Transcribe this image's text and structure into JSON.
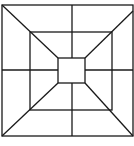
{
  "figure": {
    "stroke_color": "#1a1a1a",
    "background": "#ffffff",
    "squares": [
      {
        "name": "outer",
        "x": 2,
        "y": 5,
        "w": 131,
        "h": 131
      },
      {
        "name": "middle",
        "x": 30,
        "y": 32,
        "w": 82,
        "h": 78
      },
      {
        "name": "inner",
        "x": 58,
        "y": 58,
        "w": 27,
        "h": 25
      }
    ],
    "center_lines": {
      "vertical_x": 72,
      "horizontal_y": 70
    },
    "diagonals": [
      {
        "name": "top-left",
        "from": [
          2,
          5
        ],
        "to": [
          58,
          58
        ]
      },
      {
        "name": "top-right",
        "from": [
          133,
          11
        ],
        "to": [
          85,
          58
        ]
      },
      {
        "name": "bottom-left",
        "from": [
          2,
          136
        ],
        "to": [
          58,
          83
        ]
      },
      {
        "name": "bottom-right",
        "from": [
          133,
          136
        ],
        "to": [
          85,
          83
        ]
      }
    ]
  }
}
